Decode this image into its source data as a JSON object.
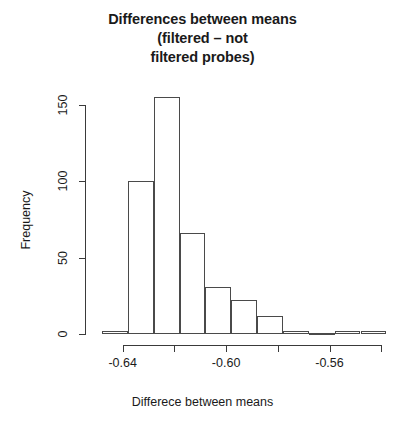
{
  "chart_data": {
    "type": "bar",
    "title": "Differences between means (filtered – not filtered probes)",
    "title_lines": [
      "Differences between means",
      "(filtered – not",
      "filtered probes)"
    ],
    "xlabel": "Differece between means",
    "ylabel": "Frequency",
    "xlim": [
      -0.648,
      -0.548
    ],
    "ylim": [
      0,
      160
    ],
    "grid": false,
    "legend": null,
    "xticks": [
      -0.64,
      -0.62,
      -0.6,
      -0.58,
      -0.56,
      -0.54
    ],
    "xtick_labels": [
      "-0.64",
      "",
      "-0.60",
      "",
      "-0.56",
      ""
    ],
    "yticks": [
      0,
      50,
      100,
      150
    ],
    "ytick_labels": [
      "0",
      "50",
      "100",
      "150"
    ],
    "bin_width": 0.01,
    "bins": [
      {
        "left": -0.648,
        "right": -0.638,
        "center": -0.643,
        "value": 2
      },
      {
        "left": -0.638,
        "right": -0.628,
        "center": -0.633,
        "value": 100
      },
      {
        "left": -0.628,
        "right": -0.618,
        "center": -0.623,
        "value": 155
      },
      {
        "left": -0.618,
        "right": -0.608,
        "center": -0.613,
        "value": 66
      },
      {
        "left": -0.608,
        "right": -0.598,
        "center": -0.603,
        "value": 31
      },
      {
        "left": -0.598,
        "right": -0.588,
        "center": -0.593,
        "value": 22
      },
      {
        "left": -0.588,
        "right": -0.578,
        "center": -0.583,
        "value": 12
      },
      {
        "left": -0.578,
        "right": -0.568,
        "center": -0.573,
        "value": 2
      },
      {
        "left": -0.568,
        "right": -0.558,
        "center": -0.563,
        "value": 0
      },
      {
        "left": -0.558,
        "right": -0.548,
        "center": -0.553,
        "value": 2
      }
    ],
    "categories": [
      "-0.643",
      "-0.633",
      "-0.623",
      "-0.613",
      "-0.603",
      "-0.593",
      "-0.583",
      "-0.573",
      "-0.563",
      "-0.553"
    ],
    "values": [
      2,
      100,
      155,
      66,
      31,
      22,
      12,
      2,
      0,
      2
    ],
    "colors": {
      "bar_fill": "#ffffff",
      "bar_border": "#4a4a4a",
      "axis": "#3a3a3a",
      "text": "#1a1a1a",
      "background": "#ffffff"
    }
  }
}
